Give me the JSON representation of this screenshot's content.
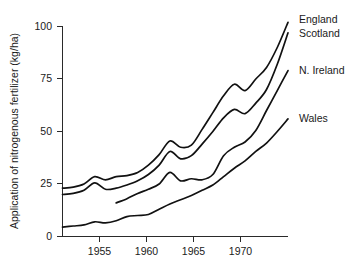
{
  "chart_data": {
    "type": "line",
    "title": "",
    "xlabel": "",
    "ylabel": "Application of nitrogenous fertilizer (kg/ha)",
    "xlim": [
      1952,
      1973
    ],
    "ylim": [
      0,
      100
    ],
    "grid": false,
    "legend_position": "right-inline-labels",
    "xticks": [
      1955,
      1960,
      1965,
      1970
    ],
    "xtick_labels": [
      "1955",
      "1960",
      "1965",
      "1970"
    ],
    "yticks": [
      0,
      25,
      50,
      75,
      100
    ],
    "ytick_labels": [
      "0",
      "25",
      "50",
      "75",
      "100"
    ],
    "series": [
      {
        "name": "England",
        "label": "England",
        "x": [
          1952,
          1953,
          1954,
          1955,
          1956,
          1957,
          1958,
          1959,
          1960,
          1961,
          1962,
          1963,
          1964,
          1965,
          1966,
          1967,
          1968,
          1969,
          1970,
          1971,
          1972,
          1973
        ],
        "values": [
          23,
          23.5,
          25,
          28.5,
          27,
          28.5,
          29,
          30.5,
          34,
          39,
          45.5,
          42.5,
          43.5,
          51,
          59,
          67,
          72.5,
          69.5,
          75,
          80.5,
          90,
          102
        ]
      },
      {
        "name": "Scotland",
        "label": "Scotland",
        "x": [
          1952,
          1953,
          1954,
          1955,
          1956,
          1957,
          1958,
          1959,
          1960,
          1961,
          1962,
          1963,
          1964,
          1965,
          1966,
          1967,
          1968,
          1969,
          1970,
          1971,
          1972,
          1973
        ],
        "values": [
          20,
          20.5,
          22,
          25.5,
          22.5,
          23,
          24.5,
          26.5,
          29.5,
          34,
          40.5,
          37,
          38.5,
          44,
          50,
          56.5,
          60.5,
          58.5,
          63.5,
          70,
          82,
          97
        ]
      },
      {
        "name": "N. Ireland",
        "label": "N. Ireland",
        "x": [
          1957,
          1958,
          1959,
          1960,
          1961,
          1962,
          1963,
          1964,
          1965,
          1966,
          1967,
          1968,
          1969,
          1970,
          1971,
          1972,
          1973
        ],
        "values": [
          16,
          18,
          20.5,
          22.5,
          25,
          30.5,
          26.5,
          27.5,
          27,
          29.5,
          38.5,
          42.5,
          45,
          50.5,
          60,
          69.5,
          79
        ]
      },
      {
        "name": "Wales",
        "label": "Wales",
        "x": [
          1952,
          1953,
          1954,
          1955,
          1956,
          1957,
          1958,
          1959,
          1960,
          1961,
          1962,
          1963,
          1964,
          1965,
          1966,
          1967,
          1968,
          1969,
          1970,
          1971,
          1972,
          1973
        ],
        "values": [
          4.5,
          5,
          5.5,
          7,
          6.5,
          7.5,
          9.5,
          10,
          10.5,
          13,
          15.5,
          17.5,
          19.5,
          22,
          24.5,
          28.5,
          32.5,
          36,
          40.5,
          44.5,
          50,
          56
        ]
      }
    ]
  },
  "labels": {
    "england": "England",
    "scotland": "Scotland",
    "n_ireland": "N. Ireland",
    "wales": "Wales",
    "y_axis_title": "Application of nitrogenous fertilizer (kg/ha)",
    "ytick_0": "0",
    "ytick_25": "25",
    "ytick_50": "50",
    "ytick_75": "75",
    "ytick_100": "100",
    "xtick_1955": "1955",
    "xtick_1960": "1960",
    "xtick_1965": "1965",
    "xtick_1970": "1970"
  },
  "colors": {
    "line": "#111111",
    "axis": "#2a2a2a",
    "text": "#1a1a1a",
    "background": "#ffffff"
  }
}
